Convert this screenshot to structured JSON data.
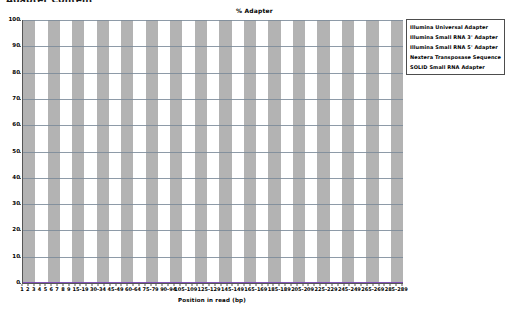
{
  "header": {
    "clipped_text": "Adapter Content"
  },
  "chart_data": {
    "type": "line",
    "title": "% Adapter",
    "xlabel": "Position in read (bp)",
    "ylabel": "",
    "ylim": [
      0,
      100
    ],
    "ytick_labels": [
      "0",
      "10",
      "20",
      "30",
      "40",
      "50",
      "60",
      "70",
      "80",
      "90",
      "100"
    ],
    "ytick_values": [
      0,
      10,
      20,
      30,
      40,
      50,
      60,
      70,
      80,
      90,
      100
    ],
    "grid": true,
    "legend_position": "top-right",
    "categories": [
      "1",
      "2",
      "3",
      "4",
      "5",
      "6",
      "7",
      "8",
      "9",
      "10-14",
      "15-19",
      "20-24",
      "25-29",
      "30-34",
      "35-39",
      "40-44",
      "45-49",
      "50-54",
      "55-59",
      "60-64",
      "65-69",
      "70-74",
      "75-79",
      "80-84",
      "85-89",
      "90-94",
      "95-99",
      "100-104",
      "105-109",
      "110-114",
      "115-119",
      "120-124",
      "125-129",
      "130-134",
      "135-139",
      "140-144",
      "145-149",
      "150-154",
      "155-159",
      "160-164",
      "165-169",
      "170-174",
      "175-179",
      "180-184",
      "185-189",
      "190-194",
      "195-199",
      "200-204",
      "205-209",
      "210-214",
      "215-219",
      "220-224",
      "225-229",
      "230-234",
      "235-239",
      "240-244",
      "245-249",
      "250-254",
      "255-259",
      "260-264",
      "265-269",
      "270-274",
      "275-279",
      "280-284",
      "285-289",
      "290-294"
    ],
    "xtick_labels": [
      "1",
      "2",
      "3",
      "4",
      "5",
      "6",
      "7",
      "8",
      "9",
      "15-19",
      "30-34",
      "45-49",
      "60-64",
      "75-79",
      "90-94",
      "105-109",
      "125-129",
      "145-149",
      "165-169",
      "185-189",
      "205-209",
      "225-229",
      "245-249",
      "265-269",
      "285-289"
    ],
    "series": [
      {
        "name": "Illumina Universal Adapter",
        "color": "#ff0000",
        "values": [
          0,
          0,
          0,
          0,
          0,
          0,
          0,
          0,
          0,
          0,
          0,
          0,
          0,
          0,
          0,
          0,
          0,
          0,
          0,
          0,
          0,
          0,
          0,
          0,
          0,
          0,
          0,
          0,
          0,
          0,
          0,
          0,
          0,
          0,
          0,
          0,
          0,
          0,
          0,
          0,
          0,
          0,
          0,
          0,
          0,
          0,
          0,
          0,
          0,
          0,
          0,
          0,
          0,
          0,
          0,
          0,
          0,
          0,
          0,
          0,
          0,
          0,
          0,
          0,
          0,
          0
        ]
      },
      {
        "name": "Illumina Small RNA 3' Adapter",
        "color": "#0000ff",
        "values": [
          0,
          0,
          0,
          0,
          0,
          0,
          0,
          0,
          0,
          0,
          0,
          0,
          0,
          0,
          0,
          0,
          0,
          0,
          0,
          0,
          0,
          0,
          0,
          0,
          0,
          0,
          0,
          0,
          0,
          0,
          0,
          0,
          0,
          0,
          0,
          0,
          0,
          0,
          0,
          0,
          0,
          0,
          0,
          0,
          0,
          0,
          0,
          0,
          0,
          0,
          0,
          0,
          0,
          0,
          0,
          0,
          0,
          0,
          0,
          0,
          0,
          0,
          0,
          0,
          0,
          0
        ]
      },
      {
        "name": "Illumina Small RNA 5' Adapter",
        "color": "#008000",
        "values": [
          0,
          0,
          0,
          0,
          0,
          0,
          0,
          0,
          0,
          0,
          0,
          0,
          0,
          0,
          0,
          0,
          0,
          0,
          0,
          0,
          0,
          0,
          0,
          0,
          0,
          0,
          0,
          0,
          0,
          0,
          0,
          0,
          0,
          0,
          0,
          0,
          0,
          0,
          0,
          0,
          0,
          0,
          0,
          0,
          0,
          0,
          0,
          0,
          0,
          0,
          0,
          0,
          0,
          0,
          0,
          0,
          0,
          0,
          0,
          0,
          0,
          0,
          0,
          0,
          0,
          0
        ]
      },
      {
        "name": "Nextera Transposase Sequence",
        "color": "#00bfbf",
        "values": [
          0,
          0,
          0,
          0,
          0,
          0,
          0,
          0,
          0,
          0,
          0,
          0,
          0,
          0,
          0,
          0,
          0,
          0,
          0,
          0,
          0,
          0,
          0,
          0,
          0,
          0,
          0,
          0,
          0,
          0,
          0,
          0,
          0,
          0,
          0,
          0,
          0,
          0,
          0,
          0,
          0,
          0,
          0,
          0,
          0,
          0,
          0,
          0,
          0,
          0,
          0,
          0,
          0,
          0,
          0,
          0,
          0,
          0,
          0,
          0,
          0,
          0,
          0,
          0,
          0,
          0
        ]
      },
      {
        "name": "SOLID Small RNA Adapter",
        "color": "#ff00ff",
        "values": [
          0,
          0,
          0,
          0,
          0,
          0,
          0,
          0,
          0,
          0,
          0,
          0,
          0,
          0,
          0,
          0,
          0,
          0,
          0,
          0,
          0,
          0,
          0,
          0,
          0,
          0,
          0,
          0,
          0,
          0,
          0,
          0,
          0,
          0,
          0,
          0,
          0,
          0,
          0,
          0,
          0,
          0,
          0,
          0,
          0,
          0,
          0,
          0,
          0,
          0,
          0,
          0,
          0,
          0,
          0,
          0,
          0,
          0,
          0,
          0,
          0,
          0,
          0,
          0,
          0,
          0
        ]
      }
    ],
    "band_count": 31,
    "colors": {
      "band_shaded": "#b3b3b3",
      "band_plain": "#ffffff",
      "gridline": "#7a8a99",
      "axis": "#555555",
      "legend_border": "#4d4d4d"
    }
  }
}
